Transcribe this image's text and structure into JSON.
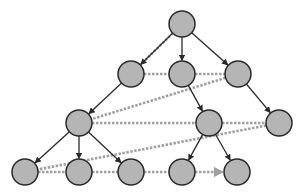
{
  "diagram": {
    "type": "tree-traversal",
    "colors": {
      "background": "#ffffff",
      "node_fill": "#b5b5b5",
      "node_stroke": "#2a2a2a",
      "tree_edge": "#2a2a2a",
      "traversal_edge": "#a0a0a0"
    },
    "node_radius": 13,
    "nodes": [
      {
        "id": "n0",
        "x": 182,
        "y": 24,
        "level": 0
      },
      {
        "id": "n1",
        "x": 131,
        "y": 74,
        "level": 1
      },
      {
        "id": "n2",
        "x": 182,
        "y": 74,
        "level": 1
      },
      {
        "id": "n3",
        "x": 238,
        "y": 74,
        "level": 1
      },
      {
        "id": "n4",
        "x": 79,
        "y": 123,
        "level": 2
      },
      {
        "id": "n5",
        "x": 209,
        "y": 123,
        "level": 2
      },
      {
        "id": "n6",
        "x": 279,
        "y": 123,
        "level": 2
      },
      {
        "id": "n7",
        "x": 25,
        "y": 172,
        "level": 3
      },
      {
        "id": "n8",
        "x": 79,
        "y": 172,
        "level": 3
      },
      {
        "id": "n9",
        "x": 131,
        "y": 172,
        "level": 3
      },
      {
        "id": "n10",
        "x": 182,
        "y": 172,
        "level": 3
      },
      {
        "id": "n11",
        "x": 237,
        "y": 172,
        "level": 3
      }
    ],
    "tree_edges": [
      [
        "n0",
        "n1"
      ],
      [
        "n0",
        "n2"
      ],
      [
        "n0",
        "n3"
      ],
      [
        "n1",
        "n4"
      ],
      [
        "n2",
        "n5"
      ],
      [
        "n3",
        "n6"
      ],
      [
        "n4",
        "n7"
      ],
      [
        "n4",
        "n8"
      ],
      [
        "n4",
        "n9"
      ],
      [
        "n5",
        "n10"
      ],
      [
        "n5",
        "n11"
      ]
    ],
    "traversal_edges": [
      [
        "n0",
        "n1"
      ],
      [
        "n1",
        "n2"
      ],
      [
        "n2",
        "n3"
      ],
      [
        "n3",
        "n4"
      ],
      [
        "n4",
        "n5"
      ],
      [
        "n5",
        "n6"
      ],
      [
        "n6",
        "n7"
      ],
      [
        "n7",
        "n8"
      ],
      [
        "n8",
        "n9"
      ],
      [
        "n9",
        "n10"
      ],
      [
        "n10",
        "n11"
      ]
    ],
    "arrow_end": "n11"
  }
}
